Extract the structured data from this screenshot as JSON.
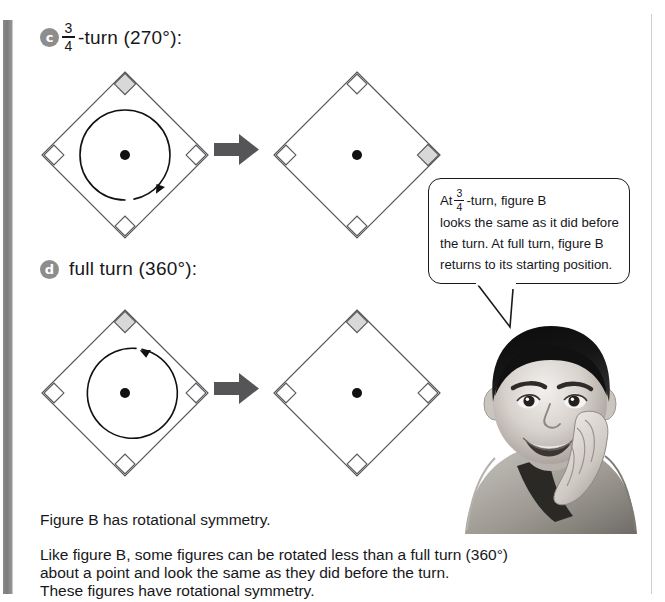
{
  "page": {
    "background": "#ffffff",
    "gutter_bar_color": "#8a8a8a",
    "text_color": "#17171a"
  },
  "items": [
    {
      "bullet": "c",
      "label_prefix": "",
      "fraction_numerator": "3",
      "fraction_denominator": "4",
      "label_suffix": "-turn (270°):",
      "arrow_icon": "right-block-arrow",
      "before": {
        "name": "figure-b-before-three-quarter-turn",
        "highlight_corner": "top",
        "rotation_arrow": "clockwise-three-quarter-arc"
      },
      "after": {
        "name": "figure-b-after-three-quarter-turn",
        "highlight_corner": "right",
        "rotation_arrow": "none"
      }
    },
    {
      "bullet": "d",
      "label_prefix": "full turn (360°):",
      "fraction_numerator": "",
      "fraction_denominator": "",
      "label_suffix": "",
      "arrow_icon": "right-block-arrow",
      "before": {
        "name": "figure-b-before-full-turn",
        "highlight_corner": "top",
        "rotation_arrow": "clockwise-full-arc"
      },
      "after": {
        "name": "figure-b-after-full-turn",
        "highlight_corner": "top",
        "rotation_arrow": "none"
      }
    }
  ],
  "callout": {
    "line1_prefix": "At",
    "line1_fraction_numerator": "3",
    "line1_fraction_denominator": "4",
    "line1_suffix": "-turn, figure B",
    "line2": "looks the same as it did before",
    "line3": "the turn. At full turn, figure B",
    "line4": "returns to its starting position."
  },
  "photo": {
    "alt": "photo-of-smiling-boy-resting-chin-on-hand"
  },
  "body": {
    "paragraph1": "Figure B has rotational symmetry.",
    "paragraph2_line1": "Like figure B, some figures can be rotated less than a full turn (360°)",
    "paragraph2_line2": "about a point and look the same as they did before the turn.",
    "paragraph2_line3": "These figures have rotational symmetry."
  },
  "colors": {
    "shape_stroke": "#58585c",
    "marker_fill": "#d8d8d8",
    "center_dot": "#111111",
    "block_arrow": "#555558",
    "bullet_bg": "#8d8d8d"
  }
}
